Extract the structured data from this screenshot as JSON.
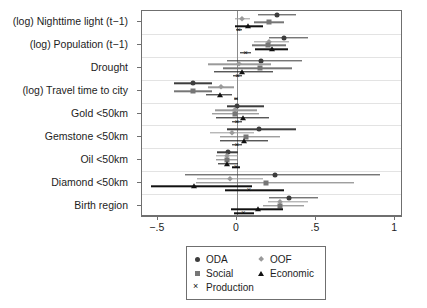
{
  "chart_data": {
    "type": "scatter",
    "subtype": "coefficient-forest-plot",
    "title": "",
    "xlabel": "",
    "ylabel": "",
    "xlim": [
      -0.6,
      1.05
    ],
    "xticks": [
      -0.5,
      0,
      0.5,
      1
    ],
    "xticklabels": [
      "−.5",
      "0",
      ".5",
      "1"
    ],
    "grid": "horizontal-band-separators",
    "zero_reference_line": 0,
    "legend_position": "bottom-center",
    "categories": [
      "(log) Nighttime light (t−1)",
      "(log) Population (t−1)",
      "Drought",
      "(log) Travel time to city",
      "Gold <50km",
      "Gemstone <50km",
      "Oil <50km",
      "Diamond <50km",
      "Birth region"
    ],
    "series": [
      {
        "name": "ODA",
        "marker": "circle",
        "color": "#3d3d3d",
        "points": [
          {
            "category": "(log) Nighttime light (t−1)",
            "estimate": 0.255,
            "ci_low": 0.135,
            "ci_high": 0.375
          },
          {
            "category": "(log) Population (t−1)",
            "estimate": 0.295,
            "ci_low": 0.2,
            "ci_high": 0.45
          },
          {
            "category": "Drought",
            "estimate": 0.15,
            "ci_low": -0.065,
            "ci_high": 0.41
          },
          {
            "category": "(log) Travel time to city",
            "estimate": -0.28,
            "ci_low": -0.4,
            "ci_high": -0.16
          },
          {
            "category": "Gold <50km",
            "estimate": 0.0,
            "ci_low": -0.06,
            "ci_high": 0.17
          },
          {
            "category": "Gemstone <50km",
            "estimate": 0.14,
            "ci_low": -0.065,
            "ci_high": 0.375
          },
          {
            "category": "Oil <50km",
            "estimate": -0.055,
            "ci_low": -0.125,
            "ci_high": 0.01
          },
          {
            "category": "Diamond <50km",
            "estimate": 0.24,
            "ci_low": -0.33,
            "ci_high": 0.905
          },
          {
            "category": "Birth region",
            "estimate": 0.33,
            "ci_low": 0.2,
            "ci_high": 0.51
          }
        ]
      },
      {
        "name": "OOF",
        "marker": "diamond",
        "color": "#9a9a9a",
        "points": [
          {
            "category": "(log) Nighttime light (t−1)",
            "estimate": 0.035,
            "ci_low": -0.01,
            "ci_high": 0.085
          },
          {
            "category": "(log) Population (t−1)",
            "estimate": 0.205,
            "ci_low": 0.11,
            "ci_high": 0.33
          },
          {
            "category": "Drought",
            "estimate": 0.015,
            "ci_low": -0.185,
            "ci_high": 0.215
          },
          {
            "category": "(log) Travel time to city",
            "estimate": -0.1,
            "ci_low": -0.185,
            "ci_high": -0.02
          },
          {
            "category": "Gold <50km",
            "estimate": -0.015,
            "ci_low": -0.14,
            "ci_high": 0.13
          },
          {
            "category": "Gemstone <50km",
            "estimate": -0.03,
            "ci_low": -0.17,
            "ci_high": 0.11
          },
          {
            "category": "Oil <50km",
            "estimate": -0.065,
            "ci_low": -0.13,
            "ci_high": 0.005
          },
          {
            "category": "Diamond <50km",
            "estimate": -0.045,
            "ci_low": -0.25,
            "ci_high": 0.165
          },
          {
            "category": "Birth region",
            "estimate": 0.27,
            "ci_low": 0.195,
            "ci_high": 0.45
          }
        ]
      },
      {
        "name": "Social",
        "marker": "square",
        "color": "#767676",
        "points": [
          {
            "category": "(log) Nighttime light (t−1)",
            "estimate": 0.2,
            "ci_low": 0.105,
            "ci_high": 0.3
          },
          {
            "category": "(log) Population (t−1)",
            "estimate": 0.195,
            "ci_low": 0.095,
            "ci_high": 0.31
          },
          {
            "category": "Drought",
            "estimate": 0.145,
            "ci_low": -0.09,
            "ci_high": 0.35
          },
          {
            "category": "(log) Travel time to city",
            "estimate": -0.275,
            "ci_low": -0.4,
            "ci_high": -0.155
          },
          {
            "category": "Gold <50km",
            "estimate": -0.01,
            "ci_low": -0.155,
            "ci_high": 0.14
          },
          {
            "category": "Gemstone <50km",
            "estimate": 0.06,
            "ci_low": -0.105,
            "ci_high": 0.27
          },
          {
            "category": "Oil <50km",
            "estimate": -0.06,
            "ci_low": -0.13,
            "ci_high": 0.01
          },
          {
            "category": "Diamond <50km",
            "estimate": 0.185,
            "ci_low": -0.26,
            "ci_high": 0.74
          },
          {
            "category": "Birth region",
            "estimate": 0.27,
            "ci_low": 0.165,
            "ci_high": 0.425
          }
        ]
      },
      {
        "name": "Economic",
        "marker": "triangle",
        "color": "#111111",
        "points": [
          {
            "category": "(log) Nighttime light (t−1)",
            "estimate": 0.07,
            "ci_low": -0.01,
            "ci_high": 0.165
          },
          {
            "category": "(log) Population (t−1)",
            "estimate": 0.22,
            "ci_low": 0.115,
            "ci_high": 0.32
          },
          {
            "category": "Drought",
            "estimate": 0.03,
            "ci_low": -0.145,
            "ci_high": 0.23
          },
          {
            "category": "(log) Travel time to city",
            "estimate": -0.11,
            "ci_low": -0.195,
            "ci_high": -0.03
          },
          {
            "category": "Gold <50km",
            "estimate": 0.04,
            "ci_low": -0.13,
            "ci_high": 0.2
          },
          {
            "category": "Gemstone <50km",
            "estimate": 0.045,
            "ci_low": -0.11,
            "ci_high": 0.195
          },
          {
            "category": "Oil <50km",
            "estimate": -0.06,
            "ci_low": -0.12,
            "ci_high": 0.005
          },
          {
            "category": "Diamond <50km",
            "estimate": -0.27,
            "ci_low": -0.545,
            "ci_high": 0.095
          },
          {
            "category": "Birth region",
            "estimate": 0.135,
            "ci_low": -0.035,
            "ci_high": 0.29
          }
        ]
      },
      {
        "name": "Production",
        "marker": "cross",
        "color": "#111111",
        "points": [
          {
            "category": "(log) Nighttime light (t−1)",
            "estimate": 0.01,
            "ci_low": -0.005,
            "ci_high": 0.03
          },
          {
            "category": "(log) Population (t−1)",
            "estimate": 0.055,
            "ci_low": 0.02,
            "ci_high": 0.09
          },
          {
            "category": "Drought",
            "estimate": 0.005,
            "ci_low": -0.025,
            "ci_high": 0.035
          },
          {
            "category": "(log) Travel time to city",
            "estimate": -0.005,
            "ci_low": -0.02,
            "ci_high": 0.01
          },
          {
            "category": "Gold <50km",
            "estimate": 0.0,
            "ci_low": -0.03,
            "ci_high": 0.03
          },
          {
            "category": "Gemstone <50km",
            "estimate": 0.0,
            "ci_low": -0.03,
            "ci_high": 0.03
          },
          {
            "category": "Oil <50km",
            "estimate": -0.005,
            "ci_low": -0.03,
            "ci_high": 0.02
          },
          {
            "category": "Diamond <50km",
            "estimate": 0.075,
            "ci_low": -0.075,
            "ci_high": 0.3
          },
          {
            "category": "Birth region",
            "estimate": 0.04,
            "ci_low": -0.02,
            "ci_high": 0.105
          }
        ]
      }
    ]
  },
  "legend": {
    "entries": [
      {
        "label": "ODA",
        "marker": "circle",
        "color": "#3d3d3d"
      },
      {
        "label": "OOF",
        "marker": "diamond",
        "color": "#9a9a9a"
      },
      {
        "label": "Social",
        "marker": "square",
        "color": "#767676"
      },
      {
        "label": "Economic",
        "marker": "triangle",
        "color": "#111111"
      },
      {
        "label": "Production",
        "marker": "cross",
        "color": "#111111"
      }
    ]
  },
  "axes": {
    "frame_color": "#6f6f6f",
    "zero_line_color": "#8a8a8a",
    "band_line_color": "#e3e3e3"
  }
}
